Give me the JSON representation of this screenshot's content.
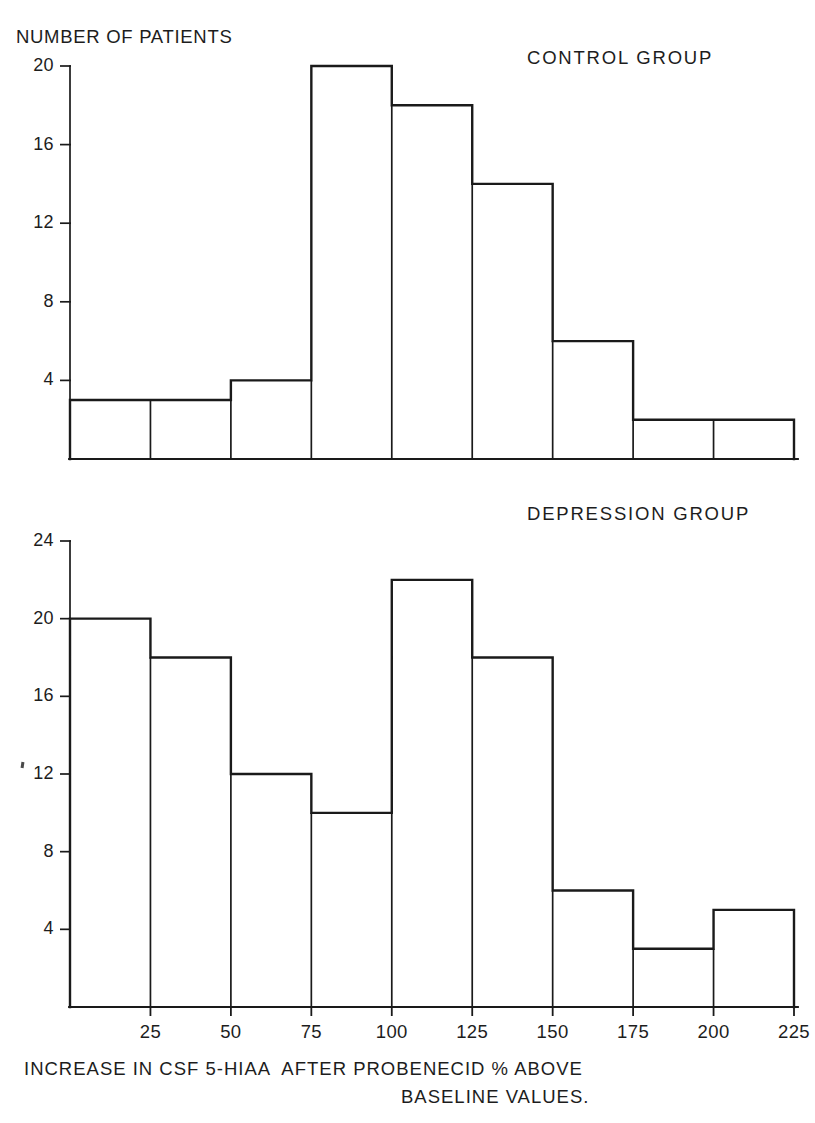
{
  "figure": {
    "y_axis_title": "NUMBER OF PATIENTS",
    "x_axis_title_line1": "INCREASE IN CSF 5-HIAA  AFTER PROBENECID % ABOVE",
    "x_axis_title_line2": "BASELINE VALUES.",
    "line_color": "#1a1a1a",
    "background_color": "#ffffff"
  },
  "chart_data": [
    {
      "type": "bar",
      "title": "CONTROL GROUP",
      "xlabel": "INCREASE IN CSF 5-HIAA AFTER PROBENECID % ABOVE BASELINE VALUES.",
      "ylabel": "NUMBER OF PATIENTS",
      "bin_edges": [
        0,
        25,
        50,
        75,
        100,
        125,
        150,
        175,
        200,
        225
      ],
      "categories": [
        "0-25",
        "25-50",
        "50-75",
        "75-100",
        "100-125",
        "125-150",
        "150-175",
        "175-200",
        "200-225"
      ],
      "values": [
        3,
        3,
        4,
        20,
        18,
        14,
        6,
        2,
        2
      ],
      "xlim": [
        0,
        225
      ],
      "ylim": [
        0,
        21
      ],
      "yticks": [
        4,
        8,
        12,
        16,
        20
      ],
      "ytick_labels": [
        "4",
        "8",
        "12",
        "16",
        "20"
      ],
      "xticks": [
        25,
        50,
        75,
        100,
        125,
        150,
        175,
        200,
        225
      ],
      "xtick_labels": [
        "25",
        "50",
        "75",
        "100",
        "125",
        "150",
        "175",
        "200",
        "225"
      ],
      "grid": false,
      "legend": "none"
    },
    {
      "type": "bar",
      "title": "DEPRESSION GROUP",
      "xlabel": "INCREASE IN CSF 5-HIAA AFTER PROBENECID % ABOVE BASELINE VALUES.",
      "ylabel": "NUMBER OF PATIENTS",
      "bin_edges": [
        0,
        25,
        50,
        75,
        100,
        125,
        150,
        175,
        200,
        225
      ],
      "categories": [
        "0-25",
        "25-50",
        "50-75",
        "75-100",
        "100-125",
        "125-150",
        "150-175",
        "175-200",
        "200-225"
      ],
      "values": [
        20,
        18,
        12,
        10,
        22,
        18,
        6,
        3,
        5
      ],
      "xlim": [
        0,
        225
      ],
      "ylim": [
        0,
        25
      ],
      "yticks": [
        4,
        8,
        12,
        16,
        20,
        24
      ],
      "ytick_labels": [
        "4",
        "8",
        "12",
        "16",
        "20",
        "24"
      ],
      "xticks": [
        25,
        50,
        75,
        100,
        125,
        150,
        175,
        200,
        225
      ],
      "xtick_labels": [
        "25",
        "50",
        "75",
        "100",
        "125",
        "150",
        "175",
        "200",
        "225"
      ],
      "grid": false,
      "legend": "none"
    }
  ]
}
